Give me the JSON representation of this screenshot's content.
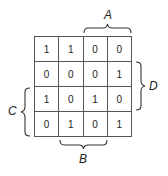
{
  "kmap": {
    "rows": [
      [
        "1",
        "1",
        "0",
        "0"
      ],
      [
        "0",
        "0",
        "0",
        "1"
      ],
      [
        "1",
        "0",
        "1",
        "0"
      ],
      [
        "0",
        "1",
        "0",
        "1"
      ]
    ]
  },
  "labels": {
    "A": "A",
    "B": "B",
    "C": "C",
    "D": "D"
  }
}
